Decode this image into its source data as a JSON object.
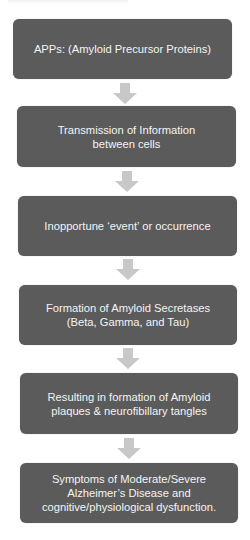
{
  "diagram": {
    "type": "vertical-flowchart",
    "colors": {
      "box_fill": "#5b5b5b",
      "box_text": "#f4f4f4",
      "arrow_fill": "#c8c8c8",
      "background": "#ffffff"
    },
    "steps": [
      {
        "label": "APPs: (Amyloid Precursor Proteins)"
      },
      {
        "label": "Transmission of Information\nbetween cells"
      },
      {
        "label": "Inopportune ‘event’ or occurrence"
      },
      {
        "label": "Formation of Amyloid Secretases\n(Beta, Gamma, and Tau)"
      },
      {
        "label": "Resulting in formation of Amyloid\nplaques & neurofibillary tangles"
      },
      {
        "label": "Symptoms of Moderate/Severe\nAlzheimer’s Disease and\ncognitive/physiological dysfunction."
      }
    ],
    "connectors": [
      {
        "icon": "down-arrow-icon"
      },
      {
        "icon": "down-arrow-icon"
      },
      {
        "icon": "down-arrow-icon"
      },
      {
        "icon": "down-arrow-icon"
      },
      {
        "icon": "down-arrow-icon"
      }
    ]
  }
}
